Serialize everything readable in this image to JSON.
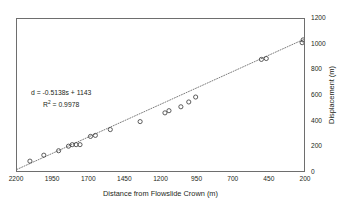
{
  "chart_data": {
    "type": "scatter",
    "title": "",
    "xlabel": "Distance from Flowslide Crown (m)",
    "ylabel": "Displacement (m)",
    "xlim": [
      2200,
      200
    ],
    "ylim": [
      0,
      1200
    ],
    "x_reversed": true,
    "grid": false,
    "legend": null,
    "xticks": [
      2200,
      1950,
      1700,
      1450,
      1200,
      950,
      700,
      450,
      200
    ],
    "yticks": [
      0,
      200,
      400,
      600,
      800,
      1000,
      1200
    ],
    "y_axis_position": "right",
    "marker": "open-circle",
    "marker_color": "#3f3f3f",
    "trendline": {
      "style": "dotted",
      "color": "#5a5a5a",
      "equation": "d = -0.5138s + 1143",
      "slope": -0.5138,
      "intercept": 1143,
      "r_squared": 0.9978
    },
    "annotations": {
      "equation_label": "d = -0.5138s + 1143",
      "r2_label_prefix": "R",
      "r2_label_sup": "2",
      "r2_label_value": " = 0.9978"
    },
    "points": [
      {
        "x": 2110,
        "y": 78
      },
      {
        "x": 2013,
        "y": 125
      },
      {
        "x": 1910,
        "y": 160
      },
      {
        "x": 1841,
        "y": 196
      },
      {
        "x": 1815,
        "y": 208
      },
      {
        "x": 1788,
        "y": 208
      },
      {
        "x": 1761,
        "y": 208
      },
      {
        "x": 1688,
        "y": 273
      },
      {
        "x": 1654,
        "y": 281
      },
      {
        "x": 1550,
        "y": 327
      },
      {
        "x": 1342,
        "y": 390
      },
      {
        "x": 1169,
        "y": 459
      },
      {
        "x": 1141,
        "y": 476
      },
      {
        "x": 1058,
        "y": 507
      },
      {
        "x": 1003,
        "y": 545
      },
      {
        "x": 955,
        "y": 584
      },
      {
        "x": 497,
        "y": 881
      },
      {
        "x": 463,
        "y": 888
      },
      {
        "x": 213,
        "y": 1013
      },
      {
        "x": 206,
        "y": 1035
      }
    ]
  }
}
